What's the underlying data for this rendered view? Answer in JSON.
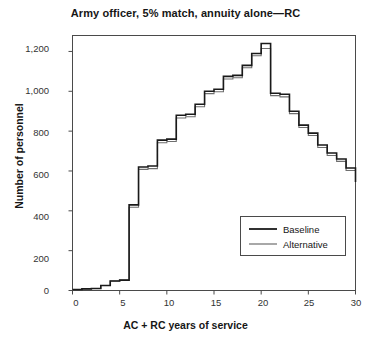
{
  "chart_data": {
    "type": "line",
    "title": "Army officer, 5% match, annuity alone—RC",
    "xlabel": "AC + RC years of service",
    "ylabel": "Number of personnel",
    "xlim": [
      0,
      30
    ],
    "ylim": [
      0,
      1280
    ],
    "xticks": [
      0,
      5,
      10,
      15,
      20,
      25,
      30
    ],
    "xtick_labels": [
      "0",
      "5",
      "10",
      "15",
      "20",
      "25",
      "30"
    ],
    "yticks": [
      0,
      200,
      400,
      600,
      800,
      1000,
      1200
    ],
    "ytick_labels": [
      "0",
      "200",
      "400",
      "600",
      "800",
      "1,000",
      "1,200"
    ],
    "grid": false,
    "drawstyle": "steps-post",
    "legend_position": "lower right",
    "x": [
      0,
      1,
      2,
      3,
      4,
      5,
      6,
      7,
      8,
      9,
      10,
      11,
      12,
      13,
      14,
      15,
      16,
      17,
      18,
      19,
      20,
      21,
      22,
      23,
      24,
      25,
      26,
      27,
      28,
      29,
      30
    ],
    "series": [
      {
        "name": "Baseline",
        "color": "#1a1a1a",
        "linewidth": 1.6,
        "values": [
          5,
          8,
          10,
          25,
          48,
          52,
          430,
          620,
          625,
          755,
          760,
          880,
          885,
          935,
          1000,
          1010,
          1075,
          1080,
          1130,
          1190,
          1240,
          990,
          985,
          900,
          830,
          790,
          730,
          690,
          660,
          615,
          545
        ]
      },
      {
        "name": "Alternative",
        "color": "#6e6e6e",
        "linewidth": 1.1,
        "values": [
          5,
          8,
          10,
          25,
          48,
          52,
          418,
          608,
          612,
          742,
          748,
          866,
          872,
          922,
          988,
          998,
          1062,
          1068,
          1118,
          1178,
          1215,
          978,
          972,
          888,
          818,
          778,
          718,
          678,
          648,
          602,
          600
        ]
      }
    ]
  },
  "legend": {
    "entries": [
      {
        "label": "Baseline"
      },
      {
        "label": "Alternative"
      }
    ]
  }
}
